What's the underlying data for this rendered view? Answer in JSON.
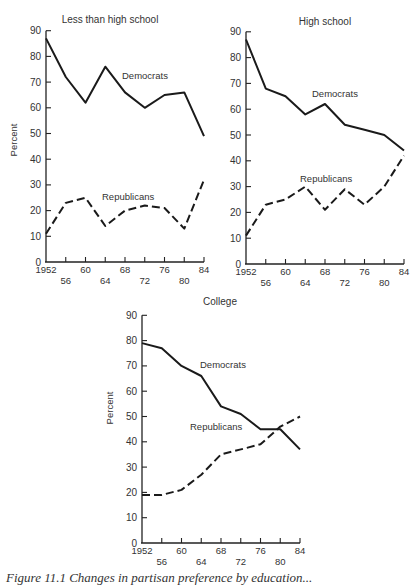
{
  "chart_data": [
    {
      "type": "line",
      "title": "Less than high school",
      "xlabel": "",
      "ylabel": "Percent",
      "ylim": [
        0,
        90
      ],
      "yticks": [
        0,
        10,
        20,
        30,
        40,
        50,
        60,
        70,
        80,
        90
      ],
      "x": [
        1952,
        1956,
        1960,
        1964,
        1968,
        1972,
        1976,
        1980,
        1984
      ],
      "xtick_labels_row1": [
        "1952",
        "60",
        "68",
        "76",
        "84"
      ],
      "xtick_labels_row2": [
        "56",
        "64",
        "72",
        "80"
      ],
      "grid": false,
      "series": [
        {
          "name": "Democrats",
          "style": "solid",
          "values": [
            87,
            72,
            62,
            76,
            66,
            60,
            65,
            66,
            49
          ]
        },
        {
          "name": "Republicans",
          "style": "dashed",
          "values": [
            11,
            23,
            25,
            14,
            20,
            22,
            21,
            13,
            32
          ]
        }
      ],
      "annotations": [
        "Democrats",
        "Republicans"
      ]
    },
    {
      "type": "line",
      "title": "High school",
      "xlabel": "",
      "ylabel": "",
      "ylim": [
        0,
        90
      ],
      "yticks": [
        0,
        10,
        20,
        30,
        40,
        50,
        60,
        70,
        80,
        90
      ],
      "x": [
        1952,
        1956,
        1960,
        1964,
        1968,
        1972,
        1976,
        1980,
        1984
      ],
      "xtick_labels_row1": [
        "1952",
        "60",
        "68",
        "76",
        "84"
      ],
      "xtick_labels_row2": [
        "56",
        "64",
        "72",
        "80"
      ],
      "grid": false,
      "series": [
        {
          "name": "Democrats",
          "style": "solid",
          "values": [
            87,
            68,
            65,
            58,
            62,
            54,
            52,
            50,
            44
          ]
        },
        {
          "name": "Republicans",
          "style": "dashed",
          "values": [
            11,
            23,
            25,
            30,
            21,
            29,
            23,
            30,
            42
          ]
        }
      ],
      "annotations": [
        "Democrats",
        "Republicans"
      ]
    },
    {
      "type": "line",
      "title": "College",
      "xlabel": "",
      "ylabel": "Percent",
      "ylim": [
        0,
        90
      ],
      "yticks": [
        0,
        10,
        20,
        30,
        40,
        50,
        60,
        70,
        80,
        90
      ],
      "x": [
        1952,
        1956,
        1960,
        1964,
        1968,
        1972,
        1976,
        1980,
        1984
      ],
      "xtick_labels_row1": [
        "1952",
        "60",
        "68",
        "76",
        "84"
      ],
      "xtick_labels_row2": [
        "56",
        "64",
        "72",
        "80"
      ],
      "grid": false,
      "series": [
        {
          "name": "Democrats",
          "style": "solid",
          "values": [
            79,
            77,
            70,
            66,
            54,
            51,
            45,
            45,
            37
          ]
        },
        {
          "name": "Republicans",
          "style": "dashed",
          "values": [
            19,
            19,
            21,
            27,
            35,
            37,
            39,
            46,
            50
          ]
        }
      ],
      "annotations": [
        "Democrats",
        "Republicans"
      ]
    }
  ],
  "panels": [
    {
      "title": "Less than high school",
      "ylabel": "Percent",
      "dem_label": "Democrats",
      "rep_label": "Republicans"
    },
    {
      "title": "High school",
      "ylabel": "",
      "dem_label": "Democrats",
      "rep_label": "Republicans"
    },
    {
      "title": "College",
      "ylabel": "Percent",
      "dem_label": "Democrats",
      "rep_label": "Republicans"
    }
  ],
  "caption": "Figure 11.1  Changes in partisan preference by education..."
}
